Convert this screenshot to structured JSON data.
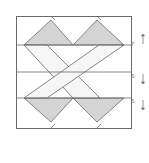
{
  "diagram": {
    "title": "",
    "colors": {
      "stroke": "#6a6a6a",
      "fill_gray": "#d4d4d4",
      "fill_light": "#f6f6f6",
      "arrow": "#777777"
    },
    "labels": {
      "row1": "7",
      "row2": "5",
      "row3": "5"
    },
    "arrows": [
      "up",
      "down",
      "down"
    ]
  }
}
